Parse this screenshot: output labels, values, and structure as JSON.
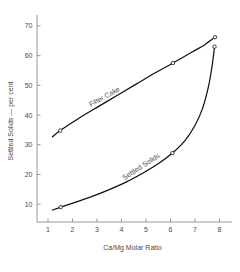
{
  "chart_data": {
    "type": "line",
    "title": "",
    "xlabel": "Ca/Mg Molar Ratio",
    "ylabel": "Settled Solids — per cent",
    "xlim": [
      0.55,
      8.35
    ],
    "ylim": [
      4.0,
      72.0
    ],
    "grid": false,
    "legend_position": "inline-curve-labels",
    "xticks": [
      1,
      2,
      3,
      4,
      5,
      6,
      7,
      8
    ],
    "xtick_labels": [
      "1",
      "2",
      "3",
      "4",
      "5",
      "6",
      "7",
      "8"
    ],
    "yticks": [
      10,
      20,
      30,
      40,
      50,
      60,
      70
    ],
    "ytick_labels": [
      "10",
      "20",
      "30",
      "40",
      "50",
      "60",
      "70"
    ],
    "series": [
      {
        "name": "Filter Cake",
        "label_angle": -29,
        "marker": "open-circle",
        "x": [
          1.18,
          1.5,
          6.1,
          7.82
        ],
        "values": [
          32.7,
          34.8,
          57.5,
          66.2
        ],
        "path_x": [
          1.18,
          1.5,
          2.2,
          3.0,
          3.8,
          4.6,
          5.4,
          6.1,
          6.9,
          7.4,
          7.82
        ],
        "path_y": [
          32.7,
          34.8,
          38.6,
          42.6,
          46.5,
          50.4,
          54.3,
          57.5,
          61.3,
          63.7,
          66.2
        ],
        "marker_x": [
          1.5,
          6.1,
          7.82
        ],
        "marker_y": [
          34.8,
          57.5,
          66.2
        ]
      },
      {
        "name": "Settled Solids",
        "label_angle": -33,
        "marker": "open-circle",
        "x": [
          1.18,
          1.52,
          6.08,
          7.8
        ],
        "values": [
          8.0,
          9.0,
          27.2,
          63.0
        ],
        "path_x": [
          1.18,
          1.52,
          2.1,
          2.8,
          3.5,
          4.2,
          4.9,
          5.5,
          6.08,
          6.6,
          7.0,
          7.3,
          7.55,
          7.7,
          7.8
        ],
        "path_y": [
          8.0,
          9.0,
          10.6,
          12.6,
          14.9,
          17.5,
          20.6,
          23.6,
          27.2,
          31.5,
          36.5,
          42.0,
          49.5,
          56.5,
          63.0
        ],
        "marker_x": [
          1.52,
          6.08,
          7.8
        ],
        "marker_y": [
          9.0,
          27.2,
          63.0
        ]
      }
    ],
    "annotations": [
      {
        "text": "Filter Cake",
        "x": 3.35,
        "y": 45.5,
        "angle": -29
      },
      {
        "text": "Settled Solids",
        "x": 4.85,
        "y": 22.0,
        "angle": -33
      }
    ],
    "colors": {
      "background": "#ffffff",
      "axis": "#8a8a8a",
      "curve": "#111111",
      "text": "#4a4a4a",
      "marker_fill": "#ffffff"
    }
  }
}
